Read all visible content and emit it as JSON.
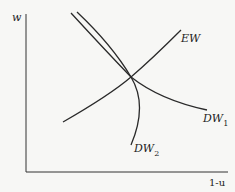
{
  "diagram": {
    "axes": {
      "y_label": "w",
      "x_label": "1-u"
    },
    "curves": [
      {
        "id": "EW",
        "label": "EW",
        "sub": ""
      },
      {
        "id": "DW1",
        "label": "DW",
        "sub": "1"
      },
      {
        "id": "DW2",
        "label": "DW",
        "sub": "2"
      }
    ],
    "colors": {
      "line": "#2a2a2a",
      "background": "#f7f7f5"
    }
  }
}
